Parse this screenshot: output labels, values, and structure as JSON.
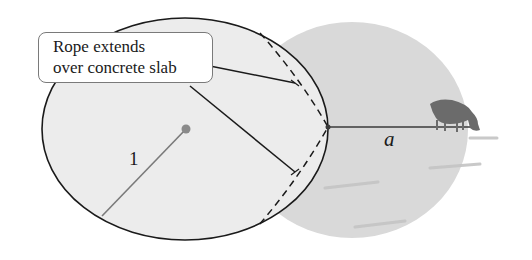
{
  "figure": {
    "callout": {
      "line1": "Rope extends",
      "line2": "over concrete slab"
    },
    "labels": {
      "radius": "1",
      "rope_length": "a"
    },
    "elements": {
      "slab": "circular concrete slab (ellipse outline)",
      "grazing_region": "gray shaded grazing area",
      "rope": "rope from slab edge to cow",
      "cow": "grazing cow icon",
      "dashed_arc": "boundary of rope extent over slab"
    },
    "colors": {
      "outline": "#1a1a1a",
      "slab_fill": "#eeeeee",
      "grazing_fill": "#d8d8d8",
      "center_dot": "#8a8a8a",
      "cow": "#6b6b6b"
    }
  }
}
